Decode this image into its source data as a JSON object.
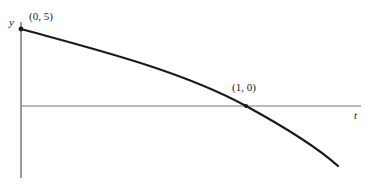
{
  "diagram": {
    "type": "function-graph",
    "axes": {
      "y_label": "y",
      "x_label": "t"
    },
    "points": [
      {
        "label": "(0, 5)",
        "x": 0,
        "y": 5
      },
      {
        "label": "(1, 0)",
        "x": 1,
        "y": 0
      }
    ],
    "curve": {
      "description": "decreasing concave-down curve from (0,5) through (1,0)",
      "color": "#1a1a1a"
    },
    "colors": {
      "axis": "#555555",
      "curve": "#1a1a1a",
      "background": "#ffffff"
    }
  }
}
